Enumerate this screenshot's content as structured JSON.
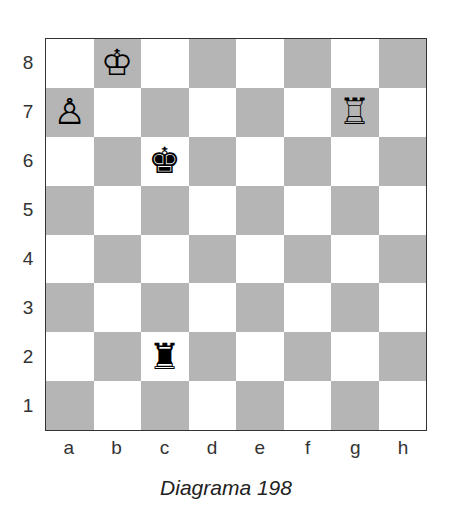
{
  "diagram": {
    "caption": "Diagrama 198",
    "colors": {
      "light_square": "#ffffff",
      "dark_square": "#b5b5b5",
      "border": "#333333"
    },
    "ranks": [
      "8",
      "7",
      "6",
      "5",
      "4",
      "3",
      "2",
      "1"
    ],
    "files": [
      "a",
      "b",
      "c",
      "d",
      "e",
      "f",
      "g",
      "h"
    ],
    "pieces": [
      {
        "square": "b8",
        "color": "white",
        "type": "king",
        "glyph": "♔"
      },
      {
        "square": "a7",
        "color": "white",
        "type": "pawn",
        "glyph": "♙"
      },
      {
        "square": "g7",
        "color": "white",
        "type": "rook",
        "glyph": "♖"
      },
      {
        "square": "c6",
        "color": "black",
        "type": "king",
        "glyph": "♚"
      },
      {
        "square": "c2",
        "color": "black",
        "type": "rook",
        "glyph": "♜"
      }
    ]
  }
}
